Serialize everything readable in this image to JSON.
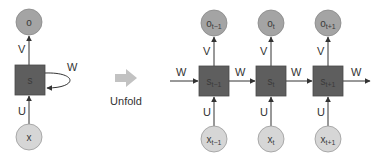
{
  "diagram": {
    "colors": {
      "output_node": "#a4a4a4",
      "input_node": "#d6d6d6",
      "state_node": "#5e5e5e",
      "edge": "#333333",
      "unfold_arrow": "#c2c2c2"
    },
    "folded": {
      "output": {
        "label": "o"
      },
      "state": {
        "label": "s"
      },
      "input": {
        "label": "x"
      },
      "edges": {
        "input_to_state": "U",
        "state_to_output": "V",
        "recurrent": "W"
      }
    },
    "unfold": {
      "label": "Unfold"
    },
    "unfolded": {
      "steps": [
        {
          "output": "o",
          "output_sub": "t−1",
          "state": "s",
          "state_sub": "t−1",
          "input": "x",
          "input_sub": "t−1",
          "U": "U",
          "V": "V"
        },
        {
          "output": "o",
          "output_sub": "t",
          "state": "s",
          "state_sub": "t",
          "input": "x",
          "input_sub": "t",
          "U": "U",
          "V": "V"
        },
        {
          "output": "o",
          "output_sub": "t+1",
          "state": "s",
          "state_sub": "t+1",
          "input": "x",
          "input_sub": "t+1",
          "U": "U",
          "V": "V"
        }
      ],
      "recurrent_labels": [
        "W",
        "W",
        "W",
        "W"
      ]
    }
  }
}
